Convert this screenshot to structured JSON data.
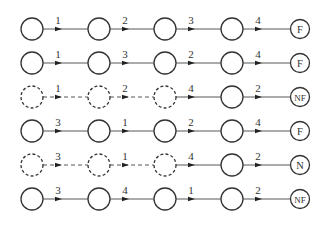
{
  "diagram": {
    "rows": [
      {
        "edges": [
          "1",
          "2",
          "3",
          "4"
        ],
        "terminal": "F",
        "dashed_nodes": 0
      },
      {
        "edges": [
          "1",
          "3",
          "2",
          "4"
        ],
        "terminal": "F",
        "dashed_nodes": 0
      },
      {
        "edges": [
          "1",
          "2",
          "4",
          "2"
        ],
        "terminal": "NF",
        "dashed_nodes": 3
      },
      {
        "edges": [
          "3",
          "1",
          "2",
          "4"
        ],
        "terminal": "F",
        "dashed_nodes": 0
      },
      {
        "edges": [
          "3",
          "1",
          "4",
          "2"
        ],
        "terminal": "N",
        "dashed_nodes": 3
      },
      {
        "edges": [
          "3",
          "4",
          "1",
          "2"
        ],
        "terminal": "NF",
        "dashed_nodes": 0
      }
    ]
  }
}
